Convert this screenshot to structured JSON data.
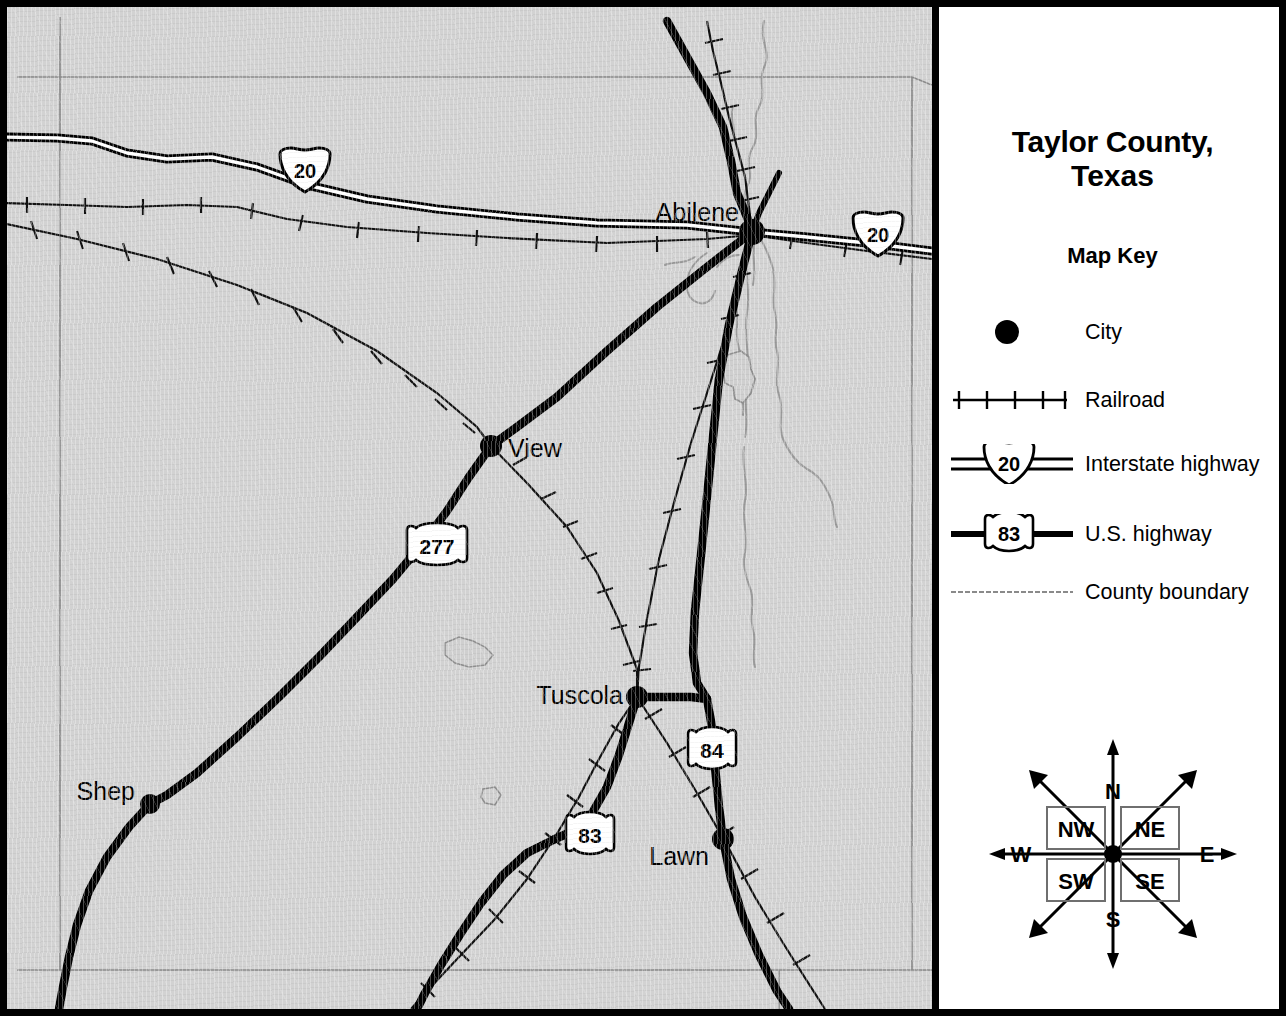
{
  "legend_panel": {
    "title_line1": "Taylor County,",
    "title_line2": "Texas",
    "map_key_heading": "Map Key",
    "entries": [
      {
        "symbol": "city-dot",
        "label": "City"
      },
      {
        "symbol": "railroad-line",
        "label": "Railroad"
      },
      {
        "symbol": "interstate-shield",
        "shield_number": "20",
        "label": "Interstate highway"
      },
      {
        "symbol": "us-highway-shield",
        "shield_number": "83",
        "label": "U.S. highway"
      },
      {
        "symbol": "county-boundary-line",
        "label": "County boundary"
      }
    ]
  },
  "compass": {
    "north": "N",
    "south": "S",
    "east": "E",
    "west": "W",
    "northwest": "NW",
    "northeast": "NE",
    "southwest": "SW",
    "southeast": "SE"
  },
  "map": {
    "cities": [
      {
        "name": "Abilene",
        "x": 745,
        "y": 225,
        "label_x": 655,
        "label_y": 206,
        "anchor": "end"
      },
      {
        "name": "View",
        "x": 484,
        "y": 439,
        "label_x": 500,
        "label_y": 450,
        "anchor": "start"
      },
      {
        "name": "Tuscola",
        "x": 630,
        "y": 690,
        "label_x": 616,
        "label_y": 697,
        "anchor": "end"
      },
      {
        "name": "Lawn",
        "x": 716,
        "y": 832,
        "label_x": 702,
        "label_y": 857,
        "anchor": "end"
      },
      {
        "name": "Shep",
        "x": 143,
        "y": 797,
        "label_x": 128,
        "label_y": 793,
        "anchor": "end"
      }
    ],
    "route_shields": [
      {
        "type": "interstate",
        "number": "20",
        "x": 298,
        "y": 164
      },
      {
        "type": "interstate",
        "number": "20",
        "x": 871,
        "y": 228
      },
      {
        "type": "us",
        "number": "277",
        "x": 430,
        "y": 540
      },
      {
        "type": "us",
        "number": "83",
        "x": 583,
        "y": 829
      },
      {
        "type": "us",
        "number": "84",
        "x": 705,
        "y": 744
      }
    ],
    "colors": {
      "land": "#d2d2d2",
      "road": "#000000",
      "boundary": "#8a8a8a",
      "water": "#9a9a9a",
      "frame": "#000000",
      "legend_background": "#ffffff"
    }
  }
}
